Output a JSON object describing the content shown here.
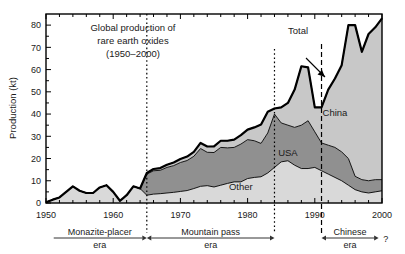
{
  "chart_data": {
    "type": "area",
    "title": [
      "Global production of",
      "rare earth oxides",
      "(1950–2000)"
    ],
    "xlabel": "",
    "ylabel": "Production (kt)",
    "xlim": [
      1950,
      2000
    ],
    "ylim": [
      0,
      85
    ],
    "yticks": [
      0,
      10,
      20,
      30,
      40,
      50,
      60,
      70,
      80
    ],
    "xticks": [
      1950,
      1960,
      1970,
      1980,
      1990,
      2000
    ],
    "xtick_labels": [
      "1950",
      "1960",
      "1970",
      "1980",
      "1990",
      "2000"
    ],
    "ytick_labels": [
      "0",
      "10",
      "20",
      "30",
      "40",
      "50",
      "60",
      "70",
      "80"
    ],
    "grid": false,
    "legend_position": "inline-annotations",
    "stacked": true,
    "x": [
      1950,
      1951,
      1952,
      1953,
      1954,
      1955,
      1956,
      1957,
      1958,
      1959,
      1960,
      1961,
      1962,
      1963,
      1964,
      1965,
      1966,
      1967,
      1968,
      1969,
      1970,
      1971,
      1972,
      1973,
      1974,
      1975,
      1976,
      1977,
      1978,
      1979,
      1980,
      1981,
      1982,
      1983,
      1984,
      1985,
      1986,
      1987,
      1988,
      1989,
      1990,
      1991,
      1992,
      1993,
      1994,
      1995,
      1996,
      1997,
      1998,
      1999,
      2000
    ],
    "series": [
      {
        "name": "Other",
        "color": "#d9d9d9",
        "values": [
          0.3,
          1.5,
          2.5,
          5.0,
          7.5,
          5.5,
          4.5,
          4.5,
          7.0,
          8.0,
          5.0,
          1.0,
          3.5,
          7.5,
          6.5,
          3.5,
          4.0,
          4.2,
          4.5,
          4.8,
          5.2,
          5.6,
          6.5,
          7.5,
          7.8,
          7.2,
          8.0,
          8.8,
          9.5,
          9.5,
          11.0,
          11.5,
          11.8,
          13.5,
          16.0,
          18.5,
          19.0,
          17.0,
          15.5,
          15.5,
          16.0,
          14.5,
          13.0,
          11.5,
          10.0,
          8.0,
          6.0,
          5.0,
          4.5,
          5.0,
          5.5
        ]
      },
      {
        "name": "USA",
        "color": "#909090",
        "values": [
          0,
          0,
          0,
          0,
          0,
          0,
          0,
          0,
          0,
          0,
          0,
          0,
          0,
          0,
          0,
          9.5,
          10.5,
          10.5,
          11.5,
          12.0,
          13.0,
          13.5,
          14.5,
          17.0,
          15.0,
          15.5,
          17.0,
          16.0,
          15.5,
          17.0,
          17.5,
          16.5,
          15.0,
          18.0,
          24.0,
          17.5,
          16.0,
          17.0,
          19.5,
          21.5,
          16.0,
          12.5,
          13.0,
          13.5,
          13.0,
          12.0,
          6.0,
          5.5,
          5.5,
          5.5,
          5.0
        ]
      },
      {
        "name": "China",
        "color": "#c8c8c8",
        "values": [
          0,
          0,
          0,
          0,
          0,
          0,
          0,
          0,
          0,
          0,
          0,
          0,
          0,
          0,
          0,
          0.5,
          0.8,
          1.0,
          1.2,
          1.4,
          1.6,
          1.8,
          2.0,
          2.5,
          2.6,
          2.8,
          3.0,
          3.2,
          3.5,
          4.0,
          4.5,
          6.0,
          8.5,
          9.5,
          2.5,
          7.0,
          10.0,
          17.0,
          26.5,
          24.0,
          11.0,
          16.0,
          25.0,
          31.0,
          39.0,
          60.0,
          68.0,
          57.5,
          66.0,
          68.5,
          72.5
        ]
      }
    ],
    "total": {
      "name": "Total",
      "values": [
        0.3,
        1.5,
        2.5,
        5.0,
        7.5,
        5.5,
        4.5,
        4.5,
        7.0,
        8.0,
        5.0,
        1.0,
        3.5,
        7.5,
        6.5,
        13.5,
        15.3,
        15.7,
        17.2,
        18.2,
        19.8,
        20.9,
        23.0,
        27.0,
        25.4,
        25.5,
        28.0,
        28.0,
        28.5,
        30.5,
        33.0,
        34.0,
        35.3,
        41.0,
        42.5,
        43.0,
        45.0,
        51.0,
        61.5,
        61.0,
        43.0,
        43.0,
        51.0,
        56.0,
        62.0,
        80.0,
        80.0,
        68.0,
        76.0,
        79.0,
        83.0
      ]
    },
    "annotations": [
      {
        "name": "total-label",
        "text": "Total",
        "x": 1987.5,
        "y": 76
      },
      {
        "name": "china-label",
        "text": "China",
        "x": 1993.0,
        "y": 39
      },
      {
        "name": "usa-label",
        "text": "USA",
        "x": 1986.0,
        "y": 21
      },
      {
        "name": "other-label",
        "text": "Other",
        "x": 1979.0,
        "y": 6
      }
    ],
    "dividers": [
      {
        "name": "divider-1965",
        "x": 1965,
        "style": "dotted",
        "y_top": 14
      },
      {
        "name": "divider-1984",
        "x": 1984,
        "style": "dotted",
        "y_top": 49
      },
      {
        "name": "divider-1991",
        "x": 1991,
        "style": "dashed",
        "y_top": 44
      }
    ],
    "eras": [
      {
        "name": "monazite-placer-era",
        "label_top": "Monazite-placer",
        "label_bottom": "era",
        "start": 1951,
        "end": 1965,
        "arrow": "right"
      },
      {
        "name": "mountain-pass-era",
        "label_top": "Mountain pass",
        "label_bottom": "era",
        "start": 1965,
        "end": 1984,
        "arrow": "both"
      },
      {
        "name": "chinese-era",
        "label_top": "Chinese",
        "label_bottom": "era",
        "start": 1991,
        "end": 1999.5,
        "arrow": "both",
        "suffix": "?"
      }
    ]
  }
}
